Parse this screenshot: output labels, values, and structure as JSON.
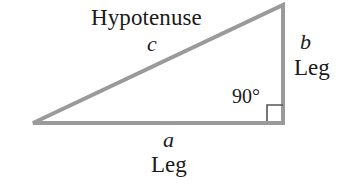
{
  "figure": {
    "background_color": "#ffffff",
    "width": 346,
    "height": 191
  },
  "diagram": {
    "shape": "right-triangle",
    "stroke_color": "#9a9a9a",
    "stroke_width": 4,
    "text_color": "#1a1a1a",
    "vertices": {
      "left": {
        "x": 33,
        "y": 123
      },
      "bottom_right": {
        "x": 283,
        "y": 123
      },
      "top_right": {
        "x": 283,
        "y": 5
      }
    },
    "right_angle_marker": {
      "x": 267,
      "y": 105,
      "size": 16,
      "stroke_color": "#555555",
      "stroke_width": 1.6
    }
  },
  "labels": {
    "hypotenuse_name": "Hypotenuse",
    "hypotenuse_var": "c",
    "vertical_leg_var": "b",
    "vertical_leg_name": "Leg",
    "angle": "90°",
    "horizontal_leg_var": "a",
    "horizontal_leg_name": "Leg"
  }
}
